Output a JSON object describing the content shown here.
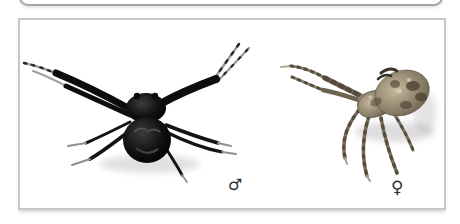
{
  "figure": {
    "specimens": [
      {
        "id": "male",
        "symbol_icon": "male-symbol",
        "glyph": "♂"
      },
      {
        "id": "female",
        "symbol_icon": "female-symbol",
        "glyph": "♀"
      }
    ]
  },
  "colors": {
    "page_bg": "#ffffff",
    "top_frame_border": "#a6a6a6",
    "panel_border": "#c7c7c9",
    "panel_bg": "#ffffff",
    "symbol_color": "#2d2d2d",
    "male_spider_dark": "#101010",
    "male_spider_leg_tip": "#9a9a9a",
    "female_spider_light": "#c6b99f",
    "female_spider_mid": "#8a7d67",
    "female_spider_dark": "#4c4437"
  }
}
